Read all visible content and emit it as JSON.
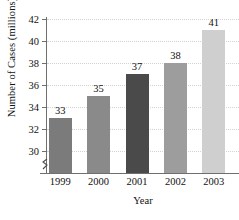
{
  "chart_data": {
    "type": "bar",
    "title": "",
    "xlabel": "Year",
    "ylabel": "Number of Cases (millions)",
    "categories": [
      "1999",
      "2000",
      "2001",
      "2002",
      "2003"
    ],
    "values": [
      33,
      35,
      37,
      38,
      41
    ],
    "value_labels": [
      "33",
      "35",
      "37",
      "38",
      "41"
    ],
    "bar_colors": [
      "#7b7b7b",
      "#8a8a8a",
      "#4a4a4a",
      "#9d9d9d",
      "#cfcfcf"
    ],
    "ylim": [
      28.8,
      42
    ],
    "yticks": [
      30,
      32,
      34,
      36,
      38,
      40,
      42
    ],
    "ytick_labels": [
      "30",
      "32",
      "34",
      "36",
      "38",
      "40",
      "42"
    ],
    "grid": "horizontal-dotted",
    "legend": "none",
    "axis_break": "y-axis-break-below-30",
    "axis_color": "#6f6f6f",
    "text_color": "#111111",
    "gridline_color": "#d2d2d2",
    "background": "#ffffff"
  }
}
